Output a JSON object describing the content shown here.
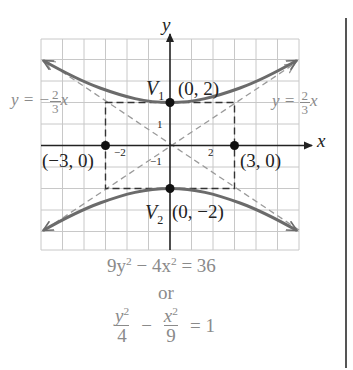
{
  "figure": {
    "axis_labels": {
      "x": "x",
      "y": "y"
    },
    "tick_labels": {
      "x_neg": "−2",
      "x_pos": "2",
      "y_pos": "1",
      "y_neg": "−1"
    },
    "vertices": {
      "v1": {
        "name": "V",
        "sub": "1",
        "coord": "(0, 2)"
      },
      "v2": {
        "name": "V",
        "sub": "2",
        "coord": "(0, −2)"
      }
    },
    "points": {
      "left": "(−3, 0)",
      "right": "(3, 0)"
    },
    "asymptotes": {
      "left": {
        "prefix": "y = −",
        "num": "2",
        "den": "3",
        "var": "x"
      },
      "right": {
        "prefix": "y = ",
        "num": "2",
        "den": "3",
        "var": "x"
      }
    },
    "equation_standard": {
      "text_a": "9y",
      "exp_a": "2",
      "text_b": " − 4x",
      "exp_b": "2",
      "text_c": " = 36"
    },
    "connector": "or",
    "equation_normalized": {
      "frac1_num": "y",
      "frac1_exp": "2",
      "frac1_den": "4",
      "op": "−",
      "frac2_num": "x",
      "frac2_exp": "2",
      "frac2_den": "9",
      "rhs": "= 1"
    },
    "grid": {
      "min": -6,
      "max": 6,
      "step": 1
    },
    "colors": {
      "curve": "#6b6b6b",
      "grid": "#c8c8c8",
      "axes": "#222222",
      "dashed": "#9a9a9a",
      "box": "#333333",
      "text_grey": "#8a8a8a"
    }
  }
}
